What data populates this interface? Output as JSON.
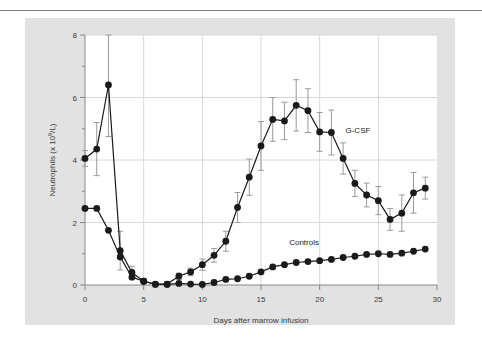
{
  "figure": {
    "panel_bg": "#e2e2e2",
    "plot_bg": "#ffffff",
    "rule_color": "#7d7d7d",
    "grid_color": "#d8d8d8",
    "axis_color": "#888888",
    "marker_color": "#1a1a1a",
    "error_color": "#9a9a9a"
  },
  "chart_data": {
    "type": "line",
    "title": "",
    "xlabel": "Days after marrow infusion",
    "ylabel": "Neutrophils (x 10⁹/L)",
    "xlim": [
      0,
      30
    ],
    "ylim": [
      0,
      8
    ],
    "xticks": [
      0,
      5,
      10,
      15,
      20,
      25,
      30
    ],
    "xtick_labels": [
      "0",
      "5",
      "10",
      "15",
      "20",
      "25",
      "30"
    ],
    "yticks": [
      0,
      2,
      4,
      6,
      8
    ],
    "ytick_labels": [
      "0",
      "2",
      "4",
      "6",
      "8"
    ],
    "yminor_ticks": [
      1,
      3,
      5,
      7
    ],
    "grid": true,
    "grid_axes": "both",
    "legend_position": "inline-annotation",
    "x": [
      0,
      1,
      2,
      3,
      4,
      5,
      6,
      7,
      8,
      9,
      10,
      11,
      12,
      13,
      14,
      15,
      16,
      17,
      18,
      19,
      20,
      21,
      22,
      23,
      24,
      25,
      26,
      27,
      28,
      29
    ],
    "series": [
      {
        "name": "G-CSF",
        "label_x": 22.2,
        "label_y": 4.85,
        "values": [
          4.05,
          4.35,
          6.4,
          1.1,
          0.4,
          0.12,
          0.03,
          0.03,
          0.28,
          0.42,
          0.65,
          0.95,
          1.4,
          2.48,
          3.45,
          4.45,
          5.3,
          5.25,
          5.75,
          5.58,
          4.9,
          4.88,
          4.05,
          3.25,
          2.88,
          2.7,
          2.1,
          2.3,
          2.95,
          3.1
        ],
        "errors": [
          0.25,
          0.85,
          1.65,
          0.62,
          0.2,
          0.08,
          0.05,
          0.05,
          0.1,
          0.12,
          0.18,
          0.22,
          0.32,
          0.48,
          0.58,
          0.78,
          0.7,
          0.6,
          0.82,
          0.7,
          0.62,
          0.72,
          0.5,
          0.42,
          0.38,
          0.45,
          0.35,
          0.58,
          0.65,
          0.35
        ]
      },
      {
        "name": "Controls",
        "label_x": 17.4,
        "label_y": 1.28,
        "values": [
          2.45,
          2.45,
          1.75,
          0.9,
          0.25,
          0.12,
          0.02,
          0.02,
          0.05,
          0.03,
          0.02,
          0.08,
          0.18,
          0.2,
          0.28,
          0.42,
          0.58,
          0.65,
          0.72,
          0.75,
          0.78,
          0.82,
          0.88,
          0.92,
          0.98,
          1.0,
          0.98,
          1.02,
          1.08,
          1.15
        ]
      }
    ]
  }
}
